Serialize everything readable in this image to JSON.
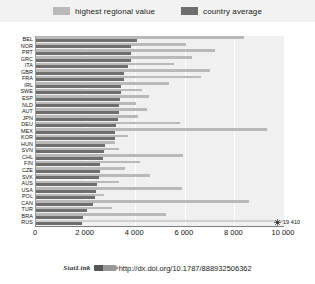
{
  "legend": {
    "items": [
      {
        "label": "highest regional value",
        "color": "#b9b9b9",
        "key": "highest_regional_value"
      },
      {
        "label": "country average",
        "color": "#6e6e6e",
        "key": "country_average"
      }
    ]
  },
  "footer": {
    "statlink_word": "StatLink",
    "url": "http://dx.doi.org/10.1787/888932506362"
  },
  "annotation": {
    "break_value_label": "19 410",
    "break_country": "RUS"
  },
  "chart_data": {
    "type": "bar",
    "orientation": "horizontal",
    "title": "",
    "subtitle": "",
    "xlabel": "",
    "ylabel": "",
    "xlim": [
      0,
      10000
    ],
    "xticks": [
      0,
      2000,
      4000,
      6000,
      8000,
      10000
    ],
    "xticklabels": [
      "0",
      "2 000",
      "4 000",
      "6 000",
      "8 000",
      "10 000"
    ],
    "grid": true,
    "grid_axis": "x",
    "legend_position": "top-center",
    "categories": [
      "BEL",
      "NOR",
      "PRT",
      "GRC",
      "ITA",
      "GBR",
      "FRA",
      "IRL",
      "SWE",
      "ESP",
      "NLD",
      "AUT",
      "JPN",
      "DEU",
      "MEX",
      "KOR",
      "HUN",
      "SVN",
      "CHL",
      "FIN",
      "CZE",
      "SVK",
      "AUS",
      "USA",
      "POL",
      "CAN",
      "TUR",
      "BRA",
      "RUS"
    ],
    "series": [
      {
        "name": "highest regional value",
        "color": "#b9b9b9",
        "values": [
          8400,
          6060,
          7220,
          6280,
          5580,
          7000,
          6640,
          5380,
          4280,
          4540,
          4040,
          4480,
          4120,
          5800,
          9320,
          3700,
          3180,
          3340,
          5940,
          4180,
          3580,
          4600,
          3340,
          5880,
          2760,
          8580,
          3060,
          5240,
          19410
        ]
      },
      {
        "name": "country average",
        "color": "#6e6e6e",
        "values": [
          4080,
          3840,
          3840,
          3840,
          3700,
          3560,
          3560,
          3440,
          3420,
          3400,
          3360,
          3340,
          3300,
          3220,
          3200,
          3180,
          2800,
          2760,
          2700,
          2600,
          2580,
          2540,
          2440,
          2400,
          2360,
          2280,
          2060,
          1900,
          1840
        ]
      }
    ],
    "notes": [
      "RUS highest regional value (19 410) exceeds the axis maximum and is drawn with an axis-break marker."
    ]
  }
}
